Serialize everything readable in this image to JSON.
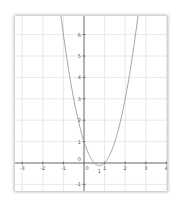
{
  "chart_data": {
    "type": "line",
    "title": "",
    "xlabel": "",
    "ylabel": "",
    "function": "y = 2x^2 - 3x + 1",
    "xlim": [
      -3.3,
      4.0
    ],
    "ylim": [
      -1.3,
      6.8
    ],
    "x_ticks": [
      -3,
      -2,
      -1,
      0,
      1,
      2,
      3,
      4
    ],
    "x_tick_labels": [
      "-3",
      "-2",
      "-1",
      "0",
      "1",
      "2",
      "3",
      "4"
    ],
    "y_ticks": [
      -1,
      0,
      1,
      2,
      3,
      4,
      5,
      6
    ],
    "y_tick_labels": [
      "-1",
      "0",
      "1",
      "2",
      "3",
      "4",
      "5",
      "6"
    ],
    "grid": true,
    "legend": null,
    "series": [
      {
        "name": "parabola",
        "x": [
          -1.2,
          -1.0,
          -0.75,
          -0.5,
          -0.25,
          0,
          0.25,
          0.5,
          0.75,
          1.0,
          1.25,
          1.5,
          1.75,
          2.0,
          2.25,
          2.5,
          2.7
        ],
        "y": [
          7.48,
          6.0,
          4.375,
          3.0,
          1.875,
          1.0,
          0.375,
          0.0,
          -0.125,
          0.0,
          0.375,
          1.0,
          1.875,
          3.0,
          4.375,
          6.0,
          7.48
        ]
      }
    ],
    "annotations": [
      {
        "text": "1",
        "x": 0.75,
        "y": -0.35
      }
    ]
  },
  "style": {
    "curve_color": "#9a9a9a",
    "axis_color": "#555555",
    "grid_color": "#e2e2e2"
  }
}
